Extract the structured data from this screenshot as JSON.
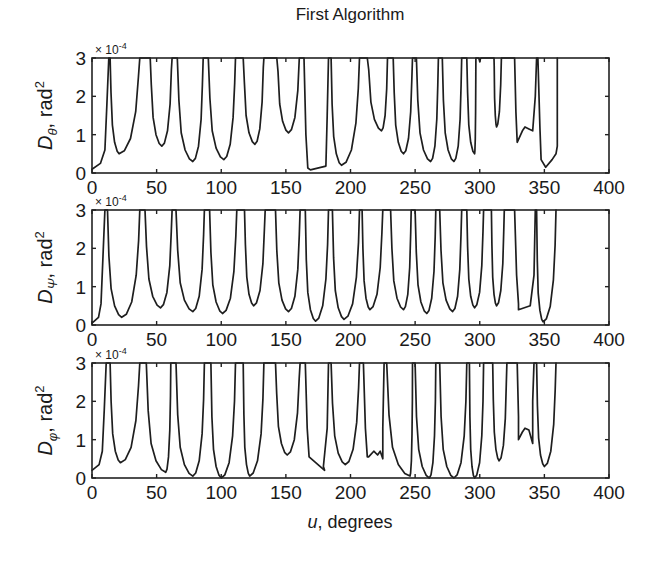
{
  "chart_data": {
    "type": "line",
    "title": "First Algorithm",
    "xlabel": "u, degrees",
    "xlim": [
      0,
      400
    ],
    "xticks": [
      0,
      50,
      100,
      150,
      200,
      250,
      300,
      350,
      400
    ],
    "grid": false,
    "legend": null,
    "panels": [
      {
        "id": "theta",
        "ylabel_symbol": "D",
        "ylabel_subscript": "θ",
        "ylabel_unit": ", rad",
        "ylabel_sup": "2",
        "exponent_label": "× 10",
        "exponent_power": "-4",
        "ylim": [
          0,
          3
        ],
        "yticks": [
          0,
          1,
          2,
          3
        ],
        "y_scale": 0.0001,
        "segments": [
          {
            "x0": 0,
            "x1": 13,
            "xmin": 0,
            "ymin": 0.1,
            "shape": "rise"
          },
          {
            "x0": 14,
            "x1": 37,
            "xmin": 21,
            "ymin": 0.5
          },
          {
            "x0": 45,
            "x1": 62,
            "xmin": 54,
            "ymin": 0.7
          },
          {
            "x0": 66,
            "x1": 86,
            "xmin": 78,
            "ymin": 0.3
          },
          {
            "x0": 90,
            "x1": 111,
            "xmin": 102,
            "ymin": 0.35
          },
          {
            "x0": 117,
            "x1": 133,
            "xmin": 126,
            "ymin": 0.75
          },
          {
            "x0": 143,
            "x1": 161,
            "xmin": 152,
            "ymin": 1.05
          },
          {
            "x0": 164,
            "x1": 183,
            "xmin": 170,
            "ymin": 0.08,
            "shape": "flat",
            "yend": 0.18
          },
          {
            "x0": 185,
            "x1": 207,
            "xmin": 193,
            "ymin": 0.2
          },
          {
            "x0": 213,
            "x1": 229,
            "xmin": 224,
            "ymin": 1.1
          },
          {
            "x0": 233,
            "x1": 248,
            "xmin": 241,
            "ymin": 0.5
          },
          {
            "x0": 251,
            "x1": 268,
            "xmin": 262,
            "ymin": 0.3
          },
          {
            "x0": 271,
            "x1": 286,
            "xmin": 280,
            "ymin": 0.3
          },
          {
            "x0": 290,
            "x1": 297,
            "xmin": 296,
            "ymin": 0.5
          },
          {
            "x0": 298,
            "x1": 302,
            "xmin": 300,
            "ymin": 2.9
          },
          {
            "x0": 311,
            "x1": 317,
            "xmin": 313,
            "ymin": 1.2
          },
          {
            "x0": 327,
            "x1": 344,
            "xmin": 329,
            "ymin": 0.8,
            "shape": "double",
            "ymid": 1.2,
            "xmid": 335,
            "ymin2": 1.1,
            "xmin2": 341
          },
          {
            "x0": 345,
            "x1": 360,
            "xmin": 351,
            "ymin": 0.15,
            "shape": "tail",
            "yend": 0.7
          }
        ]
      },
      {
        "id": "psi",
        "ylabel_symbol": "D",
        "ylabel_subscript": "Ψ",
        "ylabel_unit": ", rad",
        "ylabel_sup": "2",
        "exponent_label": "× 10",
        "exponent_power": "-4",
        "ylim": [
          0,
          3
        ],
        "yticks": [
          0,
          1,
          2,
          3
        ],
        "y_scale": 0.0001,
        "segments": [
          {
            "x0": 0,
            "x1": 10,
            "xmin": 0,
            "ymin": 0.05,
            "shape": "rise"
          },
          {
            "x0": 12,
            "x1": 37,
            "xmin": 23,
            "ymin": 0.2
          },
          {
            "x0": 41,
            "x1": 62,
            "xmin": 53,
            "ymin": 0.45
          },
          {
            "x0": 65,
            "x1": 87,
            "xmin": 78,
            "ymin": 0.35
          },
          {
            "x0": 91,
            "x1": 112,
            "xmin": 101,
            "ymin": 0.3
          },
          {
            "x0": 118,
            "x1": 134,
            "xmin": 125,
            "ymin": 0.5
          },
          {
            "x0": 142,
            "x1": 161,
            "xmin": 152,
            "ymin": 0.35
          },
          {
            "x0": 165,
            "x1": 183,
            "xmin": 173,
            "ymin": 0.1
          },
          {
            "x0": 186,
            "x1": 207,
            "xmin": 195,
            "ymin": 0.15
          },
          {
            "x0": 209,
            "x1": 225,
            "xmin": 215,
            "ymin": 0.4
          },
          {
            "x0": 231,
            "x1": 247,
            "xmin": 241,
            "ymin": 0.4
          },
          {
            "x0": 250,
            "x1": 266,
            "xmin": 259,
            "ymin": 0.3
          },
          {
            "x0": 269,
            "x1": 286,
            "xmin": 279,
            "ymin": 0.35
          },
          {
            "x0": 290,
            "x1": 303,
            "xmin": 296,
            "ymin": 0.45
          },
          {
            "x0": 309,
            "x1": 319,
            "xmin": 313,
            "ymin": 0.5
          },
          {
            "x0": 327,
            "x1": 343,
            "xmin": 330,
            "ymin": 0.4,
            "shape": "shelf",
            "yend": 0.5
          },
          {
            "x0": 344,
            "x1": 359,
            "xmin": 349,
            "ymin": 0.08
          }
        ]
      },
      {
        "id": "phi",
        "ylabel_symbol": "D",
        "ylabel_subscript": "φ",
        "ylabel_unit": ", rad",
        "ylabel_sup": "2",
        "exponent_label": "× 10",
        "exponent_power": "-4",
        "ylim": [
          0,
          3
        ],
        "yticks": [
          0,
          1,
          2,
          3
        ],
        "y_scale": 0.0001,
        "segments": [
          {
            "x0": 0,
            "x1": 11,
            "xmin": 0,
            "ymin": 0.2,
            "shape": "rise"
          },
          {
            "x0": 14,
            "x1": 37,
            "xmin": 22,
            "ymin": 0.4
          },
          {
            "x0": 42,
            "x1": 61,
            "xmin": 57,
            "ymin": 0.15
          },
          {
            "x0": 65,
            "x1": 87,
            "xmin": 78,
            "ymin": 0.05
          },
          {
            "x0": 92,
            "x1": 111,
            "xmin": 100,
            "ymin": 0.0
          },
          {
            "x0": 117,
            "x1": 133,
            "xmin": 122,
            "ymin": 0.05
          },
          {
            "x0": 142,
            "x1": 161,
            "xmin": 151,
            "ymin": 0.6
          },
          {
            "x0": 165,
            "x1": 183,
            "xmin": 180,
            "ymin": 0.2,
            "shape": "shelf",
            "yend": 0.3
          },
          {
            "x0": 185,
            "x1": 207,
            "xmin": 196,
            "ymin": 0.35
          },
          {
            "x0": 210,
            "x1": 226,
            "xmin": 214,
            "ymin": 0.55,
            "shape": "wavy",
            "yend": 0.6
          },
          {
            "x0": 228,
            "x1": 248,
            "xmin": 246,
            "ymin": 0.05
          },
          {
            "x0": 250,
            "x1": 266,
            "xmin": 261,
            "ymin": 0.0
          },
          {
            "x0": 269,
            "x1": 290,
            "xmin": 280,
            "ymin": 0.0
          },
          {
            "x0": 292,
            "x1": 303,
            "xmin": 296,
            "ymin": 0.0
          },
          {
            "x0": 310,
            "x1": 321,
            "xmin": 315,
            "ymin": 0.45
          },
          {
            "x0": 329,
            "x1": 342,
            "xmin": 330,
            "ymin": 1.0,
            "shape": "double",
            "ymid": 1.3,
            "xmid": 335,
            "ymin2": 0.9,
            "xmin2": 341
          },
          {
            "x0": 344,
            "x1": 359,
            "xmin": 350,
            "ymin": 0.3
          }
        ]
      }
    ]
  },
  "layout_px": {
    "x_left": 92,
    "x_right": 609,
    "panel_tops": [
      58,
      210,
      363
    ],
    "panel_height": 115
  }
}
